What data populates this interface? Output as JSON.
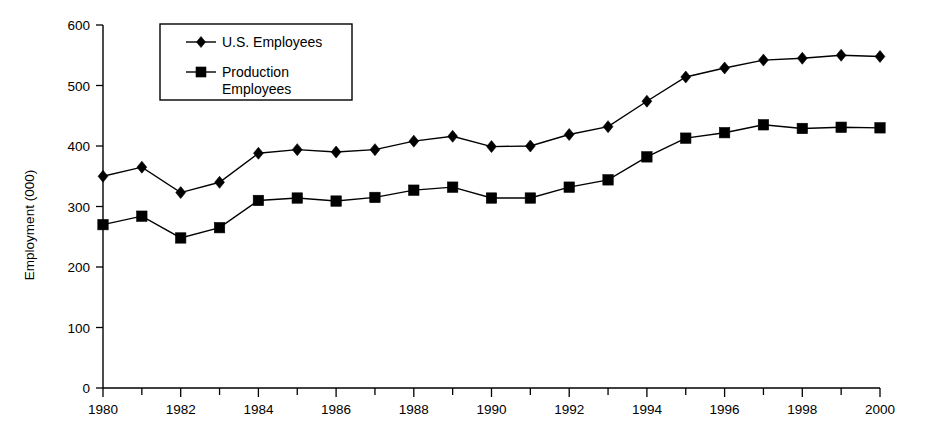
{
  "chart_data": {
    "type": "line",
    "title": "",
    "xlabel": "",
    "ylabel": "Employment (000)",
    "x": [
      1980,
      1981,
      1982,
      1983,
      1984,
      1985,
      1986,
      1987,
      1988,
      1989,
      1990,
      1991,
      1992,
      1993,
      1994,
      1995,
      1996,
      1997,
      1998,
      1999,
      2000
    ],
    "xlim": [
      1980,
      2000
    ],
    "ylim": [
      0,
      600
    ],
    "ytick_values": [
      0,
      100,
      200,
      300,
      400,
      500,
      600
    ],
    "ytick_labels": [
      "0",
      "100",
      "200",
      "300",
      "400",
      "500",
      "600"
    ],
    "xtick_values": [
      1980,
      1982,
      1984,
      1986,
      1988,
      1990,
      1992,
      1994,
      1996,
      1998,
      2000
    ],
    "xtick_labels": [
      "1980",
      "1982",
      "1984",
      "1986",
      "1988",
      "1990",
      "1992",
      "1994",
      "1996",
      "1998",
      "2000"
    ],
    "xtick_minor_values": [
      1981,
      1983,
      1985,
      1987,
      1989,
      1991,
      1993,
      1995,
      1997,
      1999
    ],
    "grid": false,
    "legend_position": "top-left-inside",
    "series": [
      {
        "name": "U.S. Employees",
        "marker": "diamond",
        "color": "#000000",
        "values": [
          350,
          365,
          323,
          340,
          388,
          394,
          390,
          394,
          408,
          416,
          399,
          400,
          419,
          432,
          474,
          514,
          529,
          542,
          545,
          550,
          548
        ]
      },
      {
        "name": "Production Employees",
        "marker": "square",
        "color": "#000000",
        "values": [
          270,
          284,
          248,
          265,
          310,
          314,
          309,
          315,
          327,
          332,
          314,
          314,
          332,
          344,
          382,
          413,
          422,
          435,
          429,
          431,
          430
        ]
      }
    ]
  },
  "legend": {
    "entries": [
      {
        "label": "U.S. Employees",
        "label_line2": ""
      },
      {
        "label": "Production",
        "label_line2": "Employees"
      }
    ]
  },
  "axes": {
    "y_title": "Employment (000)"
  }
}
